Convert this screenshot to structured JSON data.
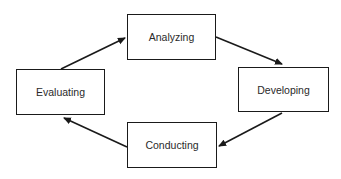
{
  "diagram": {
    "type": "cycle",
    "nodes": [
      {
        "id": "analyzing",
        "label": "Analyzing",
        "x": 127,
        "y": 14,
        "w": 89,
        "h": 46
      },
      {
        "id": "developing",
        "label": "Developing",
        "x": 238,
        "y": 67,
        "w": 91,
        "h": 45
      },
      {
        "id": "conducting",
        "label": "Conducting",
        "x": 127,
        "y": 122,
        "w": 90,
        "h": 46
      },
      {
        "id": "evaluating",
        "label": "Evaluating",
        "x": 16,
        "y": 69,
        "w": 89,
        "h": 46
      }
    ],
    "edges": [
      {
        "from": "evaluating",
        "to": "analyzing",
        "x1": 61,
        "y1": 69,
        "x2": 125,
        "y2": 38
      },
      {
        "from": "analyzing",
        "to": "developing",
        "x1": 216,
        "y1": 37,
        "x2": 282,
        "y2": 64
      },
      {
        "from": "developing",
        "to": "conducting",
        "x1": 282,
        "y1": 113,
        "x2": 219,
        "y2": 146
      },
      {
        "from": "conducting",
        "to": "evaluating",
        "x1": 127,
        "y1": 147,
        "x2": 64,
        "y2": 118
      }
    ],
    "colors": {
      "stroke": "#1a1a1a",
      "text": "#2a2a2a",
      "background": "#ffffff"
    }
  }
}
